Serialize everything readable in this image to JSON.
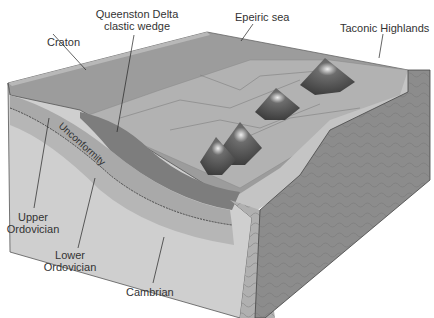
{
  "diagram": {
    "type": "geologic block diagram",
    "labels": {
      "craton": "Craton",
      "queenston_1": "Queenston Delta",
      "queenston_2": "clastic wedge",
      "epeiric_sea": "Epeiric sea",
      "taconic": "Taconic Highlands",
      "unconformity": "Unconformity",
      "upper_1": "Upper",
      "upper_2": "Ordovician",
      "lower_1": "Lower",
      "lower_2": "Ordovician",
      "cambrian": "Cambrian"
    },
    "colors": {
      "top_surface": "#9c9c9c",
      "sea_surface": "#b5b5b5",
      "front_face": "#c8c8c8",
      "right_face": "#8a8a8a",
      "wedge": "#7d7d7d",
      "strata": "#a8a8a8"
    }
  }
}
